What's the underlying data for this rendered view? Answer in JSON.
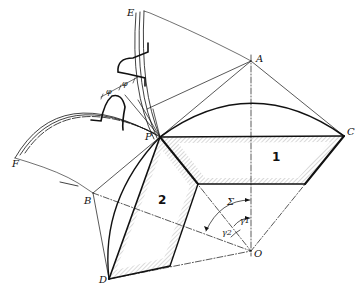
{
  "diagram": {
    "type": "bevel gear geometry",
    "points": {
      "A": "A",
      "B": "B",
      "C": "C",
      "D": "D",
      "E": "E",
      "F": "F",
      "O": "O",
      "P": "P"
    },
    "gear_labels": {
      "gear1": "1",
      "gear2": "2"
    },
    "angles": {
      "sigma": "Σ",
      "gamma1": "γ1",
      "gamma2": "γ2",
      "phi_left": "φ",
      "phi_right": "φ"
    },
    "colors": {
      "ink": "#111111",
      "background": "#ffffff"
    }
  }
}
